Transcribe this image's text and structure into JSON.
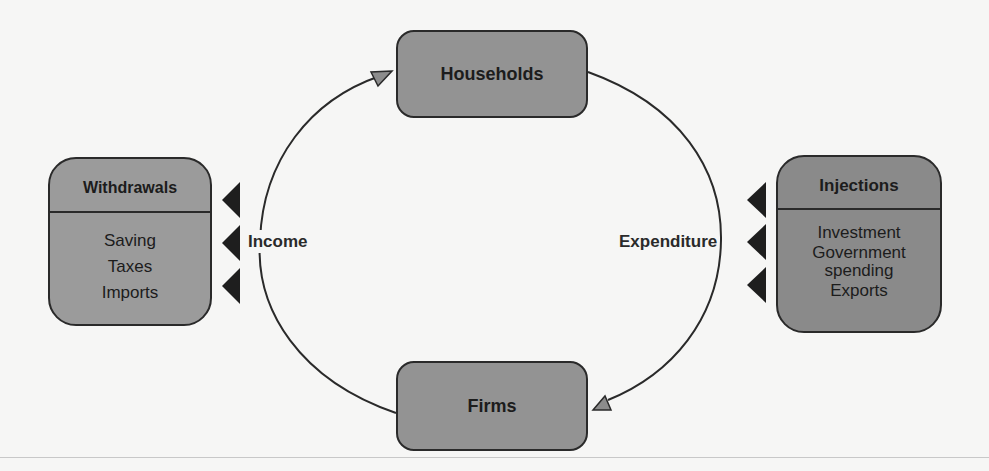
{
  "diagram": {
    "nodes": {
      "households": {
        "label": "Households"
      },
      "firms": {
        "label": "Firms"
      }
    },
    "flows": {
      "income": {
        "label": "Income",
        "direction": "firms-to-households"
      },
      "expenditure": {
        "label": "Expenditure",
        "direction": "households-to-firms"
      }
    },
    "withdrawals": {
      "title": "Withdrawals",
      "items": [
        "Saving",
        "Taxes",
        "Imports"
      ]
    },
    "injections": {
      "title": "Injections",
      "items": [
        "Investment",
        "Government",
        "spending",
        "Exports"
      ]
    },
    "colors": {
      "node_fill": "#939393",
      "withdrawals_fill": "#9b9b9b",
      "injections_fill": "#8a8a8a",
      "stroke": "#2a2a2a",
      "background": "#f6f6f5"
    }
  }
}
